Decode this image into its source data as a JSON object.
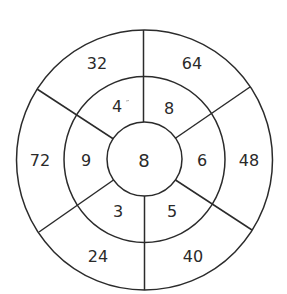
{
  "diagram": {
    "type": "concentric-ring-number-puzzle",
    "center_value": "8",
    "inner_ring": {
      "top_left": "4",
      "top_right": "8",
      "right": "6",
      "bottom_right": "5",
      "bottom_left": "3",
      "left": "9"
    },
    "outer_ring": {
      "top_left": "32",
      "top_right": "64",
      "right": "48",
      "bottom_right": "40",
      "bottom_left": "24",
      "left": "72"
    },
    "colors": {
      "line": "#2b2b2b",
      "text": "#2a2a2a",
      "background": "#ffffff"
    }
  }
}
